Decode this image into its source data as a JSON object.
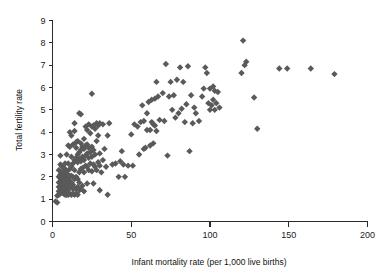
{
  "chart_data": {
    "type": "scatter",
    "title": "",
    "xlabel": "Infant mortality rate (per 1,000 live births)",
    "ylabel": "Total fertility rate",
    "xlim": [
      0,
      200
    ],
    "ylim": [
      0,
      9
    ],
    "xticks": [
      0,
      50,
      100,
      150,
      200
    ],
    "yticks": [
      0,
      1,
      2,
      3,
      4,
      5,
      6,
      7,
      8,
      9
    ],
    "grid": false,
    "legend": null,
    "marker": {
      "shape": "diamond",
      "color": "#5a5a5a",
      "size": 4
    },
    "series": [
      {
        "name": "Countries",
        "points": [
          [
            2,
            0.9
          ],
          [
            3,
            0.85
          ],
          [
            3,
            1.15
          ],
          [
            4,
            1.2
          ],
          [
            4,
            1.35
          ],
          [
            4,
            1.55
          ],
          [
            4,
            1.75
          ],
          [
            4,
            2.0
          ],
          [
            4,
            2.3
          ],
          [
            5,
            1.25
          ],
          [
            5,
            1.45
          ],
          [
            5,
            1.6
          ],
          [
            5,
            1.8
          ],
          [
            5,
            1.95
          ],
          [
            5,
            2.1
          ],
          [
            5,
            2.55
          ],
          [
            5,
            2.95
          ],
          [
            6,
            1.3
          ],
          [
            6,
            1.5
          ],
          [
            6,
            1.65
          ],
          [
            6,
            1.8
          ],
          [
            6,
            1.9
          ],
          [
            6,
            2.05
          ],
          [
            6,
            2.2
          ],
          [
            6,
            2.45
          ],
          [
            7,
            1.25
          ],
          [
            7,
            1.4
          ],
          [
            7,
            1.55
          ],
          [
            7,
            1.7
          ],
          [
            7,
            1.85
          ],
          [
            7,
            2.0
          ],
          [
            7,
            2.15
          ],
          [
            7,
            2.4
          ],
          [
            8,
            1.2
          ],
          [
            8,
            1.35
          ],
          [
            8,
            1.5
          ],
          [
            8,
            1.65
          ],
          [
            8,
            1.8
          ],
          [
            8,
            1.95
          ],
          [
            8,
            2.1
          ],
          [
            8,
            2.35
          ],
          [
            8,
            2.6
          ],
          [
            9,
            1.2
          ],
          [
            9,
            1.4
          ],
          [
            9,
            1.6
          ],
          [
            9,
            1.75
          ],
          [
            9,
            1.9
          ],
          [
            9,
            2.05
          ],
          [
            9,
            2.25
          ],
          [
            9,
            3.0
          ],
          [
            10,
            1.2
          ],
          [
            10,
            1.45
          ],
          [
            10,
            1.7
          ],
          [
            10,
            1.9
          ],
          [
            10,
            2.1
          ],
          [
            10,
            2.6
          ],
          [
            10,
            3.4
          ],
          [
            11,
            1.25
          ],
          [
            11,
            1.5
          ],
          [
            11,
            1.8
          ],
          [
            11,
            2.0
          ],
          [
            11,
            2.35
          ],
          [
            11,
            3.35
          ],
          [
            11,
            4.0
          ],
          [
            12,
            1.2
          ],
          [
            12,
            1.55
          ],
          [
            12,
            1.75
          ],
          [
            12,
            2.05
          ],
          [
            12,
            2.45
          ],
          [
            12,
            2.9
          ],
          [
            12,
            3.85
          ],
          [
            13,
            1.25
          ],
          [
            13,
            1.45
          ],
          [
            13,
            1.65
          ],
          [
            13,
            2.0
          ],
          [
            13,
            2.6
          ],
          [
            13,
            3.45
          ],
          [
            14,
            1.2
          ],
          [
            14,
            1.5
          ],
          [
            14,
            1.9
          ],
          [
            14,
            2.3
          ],
          [
            14,
            2.75
          ],
          [
            14,
            4.05
          ],
          [
            14,
            4.4
          ],
          [
            15,
            1.25
          ],
          [
            15,
            1.45
          ],
          [
            15,
            2.0
          ],
          [
            15,
            2.85
          ],
          [
            15,
            3.3
          ],
          [
            15,
            3.55
          ],
          [
            16,
            1.2
          ],
          [
            16,
            1.55
          ],
          [
            16,
            1.9
          ],
          [
            16,
            2.65
          ],
          [
            16,
            3.0
          ],
          [
            16,
            3.6
          ],
          [
            17,
            1.4
          ],
          [
            17,
            1.75
          ],
          [
            17,
            2.2
          ],
          [
            17,
            2.8
          ],
          [
            17,
            3.1
          ],
          [
            17,
            4.85
          ],
          [
            18,
            1.45
          ],
          [
            18,
            2.35
          ],
          [
            18,
            2.7
          ],
          [
            18,
            3.2
          ],
          [
            18,
            3.5
          ],
          [
            18,
            4.8
          ],
          [
            19,
            1.6
          ],
          [
            19,
            2.4
          ],
          [
            19,
            2.9
          ],
          [
            19,
            3.35
          ],
          [
            20,
            1.35
          ],
          [
            20,
            2.2
          ],
          [
            20,
            2.75
          ],
          [
            20,
            3.25
          ],
          [
            20,
            3.7
          ],
          [
            21,
            2.5
          ],
          [
            21,
            2.95
          ],
          [
            21,
            3.4
          ],
          [
            21,
            4.25
          ],
          [
            22,
            1.7
          ],
          [
            22,
            2.45
          ],
          [
            22,
            3.05
          ],
          [
            22,
            3.45
          ],
          [
            22,
            4.1
          ],
          [
            23,
            2.3
          ],
          [
            23,
            2.85
          ],
          [
            23,
            3.3
          ],
          [
            23,
            4.35
          ],
          [
            24,
            2.6
          ],
          [
            24,
            3.1
          ],
          [
            24,
            3.95
          ],
          [
            25,
            2.25
          ],
          [
            25,
            2.9
          ],
          [
            25,
            3.35
          ],
          [
            25,
            4.25
          ],
          [
            25,
            5.72
          ],
          [
            26,
            1.7
          ],
          [
            26,
            2.55
          ],
          [
            26,
            3.2
          ],
          [
            26,
            4.3
          ],
          [
            27,
            2.45
          ],
          [
            27,
            3.0
          ],
          [
            27,
            4.15
          ],
          [
            28,
            2.3
          ],
          [
            28,
            3.6
          ],
          [
            28,
            4.4
          ],
          [
            29,
            2.65
          ],
          [
            29,
            3.85
          ],
          [
            29,
            4.3
          ],
          [
            30,
            1.4
          ],
          [
            30,
            2.5
          ],
          [
            30,
            3.05
          ],
          [
            30,
            4.4
          ],
          [
            31,
            2.2
          ],
          [
            32,
            2.75
          ],
          [
            32,
            4.35
          ],
          [
            33,
            3.25
          ],
          [
            34,
            2.45
          ],
          [
            35,
            1.2
          ],
          [
            35,
            3.85
          ],
          [
            36,
            4.4
          ],
          [
            38,
            2.55
          ],
          [
            40,
            2.6
          ],
          [
            42,
            2.0
          ],
          [
            43,
            2.7
          ],
          [
            44,
            3.15
          ],
          [
            45,
            2.55
          ],
          [
            46,
            2.0
          ],
          [
            48,
            2.5
          ],
          [
            50,
            3.9
          ],
          [
            51,
            2.5
          ],
          [
            52,
            4.35
          ],
          [
            54,
            4.25
          ],
          [
            55,
            3.0
          ],
          [
            56,
            4.45
          ],
          [
            57,
            5.2
          ],
          [
            58,
            4.5
          ],
          [
            58,
            3.25
          ],
          [
            59,
            3.3
          ],
          [
            60,
            4.1
          ],
          [
            60,
            4.85
          ],
          [
            61,
            5.35
          ],
          [
            62,
            4.1
          ],
          [
            62,
            3.4
          ],
          [
            63,
            4.45
          ],
          [
            63,
            5.45
          ],
          [
            64,
            3.5
          ],
          [
            64,
            4.35
          ],
          [
            65,
            4.3
          ],
          [
            65,
            5.5
          ],
          [
            66,
            4.05
          ],
          [
            66,
            6.25
          ],
          [
            67,
            5.6
          ],
          [
            68,
            4.55
          ],
          [
            70,
            5.75
          ],
          [
            71,
            4.5
          ],
          [
            72,
            7.05
          ],
          [
            73,
            2.95
          ],
          [
            74,
            5.6
          ],
          [
            75,
            6.25
          ],
          [
            76,
            5.0
          ],
          [
            77,
            5.65
          ],
          [
            78,
            4.65
          ],
          [
            79,
            6.35
          ],
          [
            80,
            4.85
          ],
          [
            81,
            6.9
          ],
          [
            82,
            5.05
          ],
          [
            83,
            6.25
          ],
          [
            84,
            4.45
          ],
          [
            85,
            5.25
          ],
          [
            86,
            6.95
          ],
          [
            87,
            3.15
          ],
          [
            88,
            5.65
          ],
          [
            89,
            4.4
          ],
          [
            90,
            5.1
          ],
          [
            91,
            4.85
          ],
          [
            93,
            4.5
          ],
          [
            95,
            5.6
          ],
          [
            96,
            5.95
          ],
          [
            97,
            6.9
          ],
          [
            98,
            6.65
          ],
          [
            99,
            5.3
          ],
          [
            100,
            5.0
          ],
          [
            100,
            5.95
          ],
          [
            101,
            5.2
          ],
          [
            102,
            5.45
          ],
          [
            102,
            6.05
          ],
          [
            103,
            5.0
          ],
          [
            103,
            5.85
          ],
          [
            104,
            5.3
          ],
          [
            105,
            5.8
          ],
          [
            106,
            5.1
          ],
          [
            120,
            6.65
          ],
          [
            121,
            8.1
          ],
          [
            122,
            7.0
          ],
          [
            123,
            7.15
          ],
          [
            128,
            5.55
          ],
          [
            130,
            4.15
          ],
          [
            144,
            6.85
          ],
          [
            149,
            6.85
          ],
          [
            164,
            6.85
          ],
          [
            179,
            6.6
          ]
        ]
      }
    ]
  },
  "axes": {
    "x_title": "Infant mortality rate (per 1,000 live births)",
    "y_title": "Total fertility rate",
    "x_tick_labels": [
      "0",
      "50",
      "100",
      "150",
      "200"
    ],
    "y_tick_labels": [
      "0",
      "1",
      "2",
      "3",
      "4",
      "5",
      "6",
      "7",
      "8",
      "9"
    ]
  },
  "colors": {
    "marker": "#5a5a5a",
    "axis": "#2b2b2b",
    "background": "#ffffff"
  }
}
